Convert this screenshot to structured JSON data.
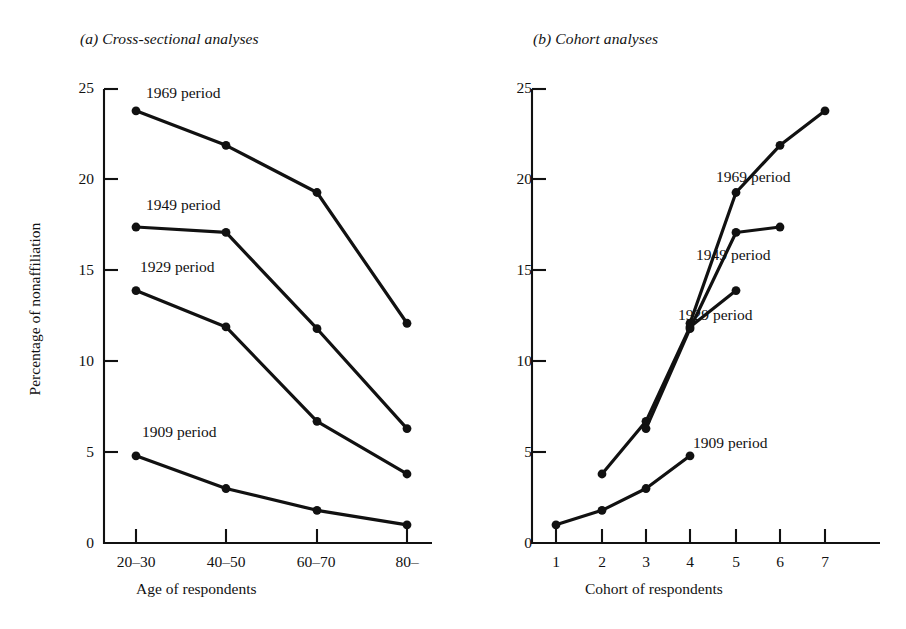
{
  "figure": {
    "panel_a_title": "(a) Cross-sectional analyses",
    "panel_b_title": "(b) Cohort analyses",
    "y_axis_label": "Percentage of nonaffiliation",
    "panel_a_x_axis_label": "Age of respondents",
    "panel_b_x_axis_label": "Cohort of respondents",
    "y_ticks": [
      "0",
      "5",
      "10",
      "15",
      "20",
      "25"
    ],
    "panel_a_x_ticks": [
      "20–30",
      "40–50",
      "60–70",
      "80–"
    ],
    "panel_b_x_ticks": [
      "1",
      "2",
      "3",
      "4",
      "5",
      "6",
      "7"
    ],
    "series_labels": {
      "p1909": "1909 period",
      "p1929": "1929 period",
      "p1949": "1949 period",
      "p1969": "1969 period"
    },
    "line_color": "#111111"
  },
  "chart_data": [
    {
      "type": "line",
      "title": "(a) Cross-sectional analyses",
      "xlabel": "Age of respondents",
      "ylabel": "Percentage of nonaffiliation",
      "categories": [
        "20-30",
        "40-50",
        "60-70",
        "80-"
      ],
      "ylim": [
        0,
        25
      ],
      "yticks": [
        0,
        5,
        10,
        15,
        20,
        25
      ],
      "grid": false,
      "legend": "inline-labels",
      "series": [
        {
          "name": "1969 period",
          "values": [
            23.8,
            21.9,
            19.3,
            12.1
          ]
        },
        {
          "name": "1949 period",
          "values": [
            17.4,
            17.1,
            11.8,
            6.3
          ]
        },
        {
          "name": "1929 period",
          "values": [
            13.9,
            11.9,
            6.7,
            3.8
          ]
        },
        {
          "name": "1909 period",
          "values": [
            4.8,
            3.0,
            1.8,
            1.0
          ]
        }
      ]
    },
    {
      "type": "line",
      "title": "(b) Cohort analyses",
      "xlabel": "Cohort of respondents",
      "ylabel": "Percentage of nonaffiliation",
      "x": [
        1,
        2,
        3,
        4,
        5,
        6,
        7
      ],
      "ylim": [
        0,
        25
      ],
      "yticks": [
        0,
        5,
        10,
        15,
        20,
        25
      ],
      "grid": false,
      "legend": "inline-labels",
      "series": [
        {
          "name": "1909 period",
          "x": [
            1,
            2,
            3,
            4
          ],
          "values": [
            1.0,
            1.8,
            3.0,
            4.8
          ]
        },
        {
          "name": "1929 period",
          "x": [
            2,
            3,
            4,
            5
          ],
          "values": [
            3.8,
            6.7,
            11.9,
            13.9
          ]
        },
        {
          "name": "1949 period",
          "x": [
            3,
            4,
            5,
            6
          ],
          "values": [
            6.3,
            11.8,
            17.1,
            17.4
          ]
        },
        {
          "name": "1969 period",
          "x": [
            4,
            5,
            6,
            7
          ],
          "values": [
            12.1,
            19.3,
            21.9,
            23.8
          ]
        }
      ]
    }
  ]
}
